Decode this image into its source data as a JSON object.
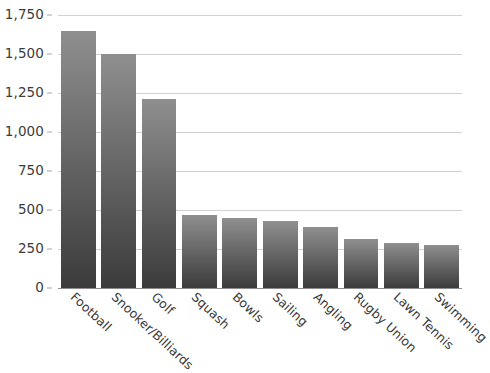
{
  "chart_data": {
    "type": "bar",
    "title": "",
    "subtitle": "",
    "xlabel": "",
    "ylabel": "",
    "ylim": [
      0,
      1750
    ],
    "yticks": [
      0,
      250,
      500,
      750,
      1000,
      1250,
      1500,
      1750
    ],
    "ytick_labels": [
      "0",
      "250",
      "500",
      "750",
      "1,000",
      "1,250",
      "1,500",
      "1,750"
    ],
    "grid": true,
    "legend": false,
    "legend_position": "none",
    "categories": [
      "Football",
      "Snooker/Billiards",
      "Golf",
      "Squash",
      "Bowls",
      "Sailing",
      "Angling",
      "Rugby Union",
      "Lawn Tennis",
      "Swimming"
    ],
    "values": [
      1650,
      1500,
      1210,
      465,
      450,
      430,
      390,
      315,
      290,
      275
    ],
    "bar_gradient": {
      "top": "#8f8f8f",
      "bottom": "#3b3b3b"
    },
    "gridline_color": "#d2d2d2",
    "axis_color": "#8c8c8c",
    "text_color": "#3c3c3c"
  }
}
